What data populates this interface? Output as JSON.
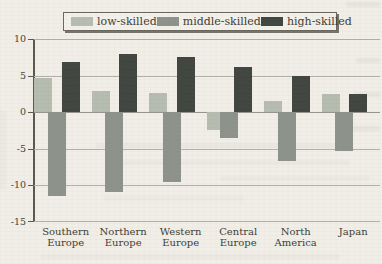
{
  "figure": {
    "kind": "scanned-book-bar-chart"
  },
  "legend": {
    "position": "top"
  },
  "chart_data": {
    "type": "bar",
    "categories": [
      "Southern Europe",
      "Northern Europe",
      "Western Europe",
      "Central Europe",
      "North America",
      "Japan"
    ],
    "category_lines": [
      [
        "Southern",
        "Europe"
      ],
      [
        "Northern",
        "Europe"
      ],
      [
        "Western",
        "Europe"
      ],
      [
        "Central",
        "Europe"
      ],
      [
        "North",
        "America"
      ],
      [
        "Japan"
      ]
    ],
    "series": [
      {
        "name": "low-skilled",
        "color": "#b7bcb1",
        "values": [
          4.6,
          2.9,
          2.6,
          -2.5,
          1.5,
          2.4
        ]
      },
      {
        "name": "middle-skilled",
        "color": "#8d928b",
        "values": [
          -11.5,
          -10.9,
          -9.6,
          -3.6,
          -6.7,
          -5.3
        ]
      },
      {
        "name": "high-skilled",
        "color": "#424641",
        "values": [
          6.9,
          8.0,
          7.6,
          6.1,
          5.0,
          2.4
        ]
      }
    ],
    "yticks": [
      10,
      5,
      0,
      -5,
      -10,
      -15
    ],
    "ylim": [
      -15,
      10
    ],
    "grid": true,
    "legend_position": "top",
    "title": "",
    "xlabel": "",
    "ylabel": ""
  }
}
